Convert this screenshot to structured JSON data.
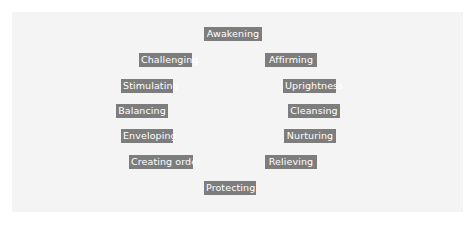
{
  "diagram": {
    "type": "circular-label-arrangement",
    "colors": {
      "background": "#ffffff",
      "panel": "#f4f4f4",
      "label_fill": "#7d7d7d",
      "label_text": "#ffffff"
    },
    "labels": [
      {
        "id": "awakening",
        "text": "Awakening",
        "position": "top"
      },
      {
        "id": "affirming",
        "text": "Affirming",
        "position": "upper-right"
      },
      {
        "id": "uprightness",
        "text": "Uprightness",
        "position": "right-1"
      },
      {
        "id": "cleansing",
        "text": "Cleansing",
        "position": "right-2"
      },
      {
        "id": "nurturing",
        "text": "Nurturing",
        "position": "right-3"
      },
      {
        "id": "relieving",
        "text": "Relieving",
        "position": "lower-right"
      },
      {
        "id": "protecting",
        "text": "Protecting",
        "position": "bottom"
      },
      {
        "id": "creating-order",
        "text": "Creating order",
        "position": "lower-left"
      },
      {
        "id": "enveloping",
        "text": "Enveloping",
        "position": "left-3"
      },
      {
        "id": "balancing",
        "text": "Balancing",
        "position": "left-2"
      },
      {
        "id": "stimulating",
        "text": "Stimulating",
        "position": "left-1"
      },
      {
        "id": "challenging",
        "text": "Challenging",
        "position": "upper-left"
      }
    ]
  }
}
